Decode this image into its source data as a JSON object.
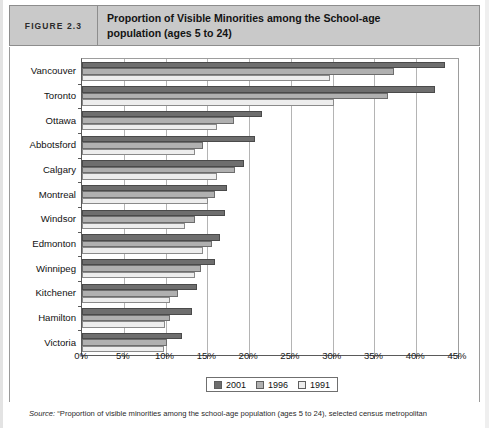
{
  "figure": {
    "number_label": "FIGURE 2.3",
    "title_line1": "Proportion of Visible Minorities among the School-age",
    "title_line2": "population (ages 5 to 24)",
    "header_bg": "#c9c9c9",
    "header_border": "#8d8d8d"
  },
  "legend": {
    "position": "bottom-center",
    "entries": [
      {
        "label": "2001",
        "color": "#6e6e6e"
      },
      {
        "label": "1996",
        "color": "#b0b0b0"
      },
      {
        "label": "1991",
        "color": "#ededed"
      }
    ]
  },
  "source": {
    "prefix": "Source:",
    "text": " “Proportion of visible minorities among the school-age population (ages 5 to 24), selected census metropolitan"
  },
  "chart_data": {
    "type": "bar",
    "orientation": "horizontal",
    "title": "Proportion of Visible Minorities among the School-age population (ages 5 to 24)",
    "xlabel": "",
    "ylabel": "",
    "xlim": [
      0,
      45
    ],
    "xtick_labels": [
      "0%",
      "5%",
      "10%",
      "15%",
      "20%",
      "25%",
      "30%",
      "35%",
      "40%",
      "45%"
    ],
    "xticks": [
      0,
      5,
      10,
      15,
      20,
      25,
      30,
      35,
      40,
      45
    ],
    "grid": "vertical",
    "categories": [
      "Vancouver",
      "Toronto",
      "Ottawa",
      "Abbotsford",
      "Calgary",
      "Montreal",
      "Windsor",
      "Edmonton",
      "Winnipeg",
      "Kitchener",
      "Hamilton",
      "Victoria"
    ],
    "series": [
      {
        "name": "2001",
        "color": "#6e6e6e",
        "values": [
          43.4,
          42.2,
          21.5,
          20.7,
          19.4,
          17.3,
          17.1,
          16.5,
          15.9,
          13.8,
          13.2,
          12.0
        ]
      },
      {
        "name": "1996",
        "color": "#b0b0b0",
        "values": [
          37.4,
          36.6,
          18.2,
          14.5,
          18.3,
          15.9,
          13.5,
          15.6,
          14.3,
          11.5,
          10.5,
          10.2
        ]
      },
      {
        "name": "1991",
        "color": "#ededed",
        "values": [
          29.7,
          30.1,
          16.1,
          13.5,
          16.1,
          15.1,
          12.3,
          14.5,
          13.5,
          10.5,
          9.9,
          9.8
        ]
      }
    ]
  }
}
